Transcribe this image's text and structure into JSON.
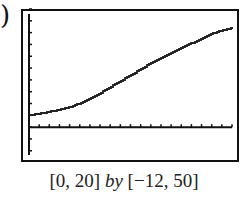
{
  "label_fragment": ")",
  "caption": {
    "xwin": "[0, 20]",
    "by": "by",
    "ywin": "[−12, 50]"
  },
  "chart_data": {
    "type": "line",
    "title": "",
    "xlabel": "",
    "ylabel": "",
    "xlim": [
      0,
      20
    ],
    "ylim": [
      -12,
      50
    ],
    "xscale_tick": 1,
    "yscale_tick": 5,
    "grid": false,
    "legend": null,
    "caption": "[0, 20] by [−12, 50]",
    "x": [
      0,
      2,
      4,
      6,
      8,
      10,
      12,
      14,
      16,
      18,
      20
    ],
    "series": [
      {
        "name": "f(x)",
        "values": [
          5,
          6.5,
          8.5,
          12,
          17,
          22,
          27,
          31.5,
          35.5,
          39.5,
          42
        ]
      }
    ]
  },
  "colors": {
    "axis": "#111111",
    "curve": "#222222",
    "frame": "#111111"
  }
}
